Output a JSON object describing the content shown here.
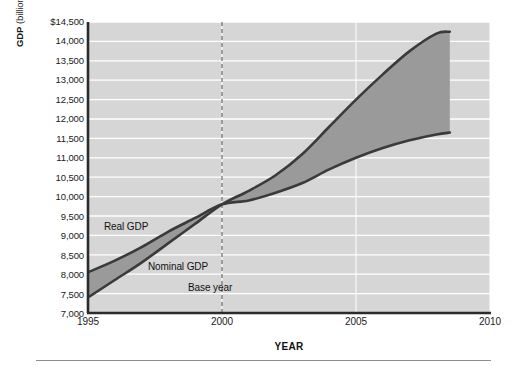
{
  "chart_data": {
    "type": "area",
    "title": "",
    "xlabel": "YEAR",
    "ylabel": "GDP (billions of dollars per year)",
    "ylabel_bold_prefix": "GDP",
    "ylabel_rest": " (billions of dollars per year)",
    "xlim": [
      1995,
      2010
    ],
    "ylim": [
      7000,
      14500
    ],
    "grid": true,
    "gridlines": "horizontal white lines every 500",
    "legend_position": "inline annotations on plot",
    "x_ticks": [
      1995,
      2000,
      2005,
      2010
    ],
    "x_tick_labels": [
      "1995",
      "2000",
      "2005",
      "2010"
    ],
    "y_ticks": [
      14500,
      14000,
      13500,
      13000,
      12500,
      12000,
      11500,
      11000,
      10500,
      10000,
      9500,
      9000,
      8500,
      8000,
      7500,
      7000
    ],
    "y_tick_labels": [
      "$14,500",
      "14,000",
      "13,500",
      "13,000",
      "12,500",
      "12,000",
      "11,500",
      "11,000",
      "10,500",
      "10,000",
      "9,500",
      "9,000",
      "8,500",
      "8,000",
      "7,500",
      "7,000"
    ],
    "annotations": [
      {
        "text": "Real GDP",
        "x": 1996.6,
        "y": 9250
      },
      {
        "text": "Nominal GDP",
        "x": 1998.2,
        "y": 7900
      },
      {
        "text": "Base year",
        "x": 1999.3,
        "y": 7450
      }
    ],
    "base_year": 2000,
    "base_year_line": "dashed vertical at 2000",
    "x": [
      1995,
      1996,
      1997,
      1998,
      1999,
      2000,
      2001,
      2002,
      2003,
      2004,
      2005,
      2006,
      2007,
      2008,
      2008.5
    ],
    "series": [
      {
        "name": "Real GDP",
        "values": [
          8050,
          8350,
          8700,
          9100,
          9450,
          9800,
          9900,
          10100,
          10350,
          10700,
          11000,
          11250,
          11450,
          11600,
          11650
        ],
        "color": "#3a3a3a"
      },
      {
        "name": "Nominal GDP",
        "values": [
          7400,
          7850,
          8300,
          8800,
          9300,
          9800,
          10150,
          10550,
          11100,
          11800,
          12500,
          13150,
          13750,
          14200,
          14250
        ],
        "color": "#3a3a3a"
      }
    ],
    "fill_between_color": "#9a9a9a",
    "plot_background": "#d6d6d6",
    "gridline_color": "#ffffff"
  },
  "labels": {
    "real_gdp": "Real GDP",
    "nominal_gdp": "Nominal GDP",
    "base_year": "Base year",
    "axis_x": "YEAR"
  }
}
